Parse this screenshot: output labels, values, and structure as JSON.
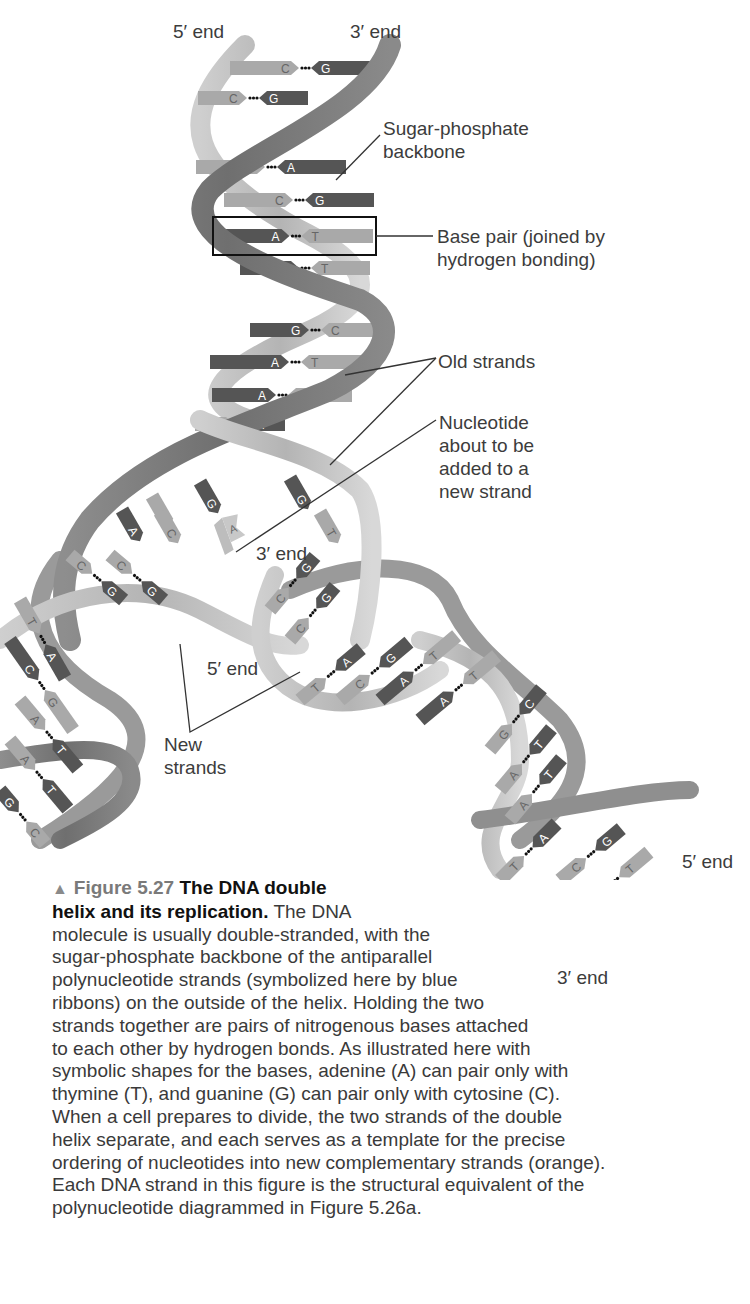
{
  "figure": {
    "labels": {
      "top_5_end": "5′ end",
      "top_3_end": "3′ end",
      "sugar_phosphate": [
        "Sugar-phosphate",
        "backbone"
      ],
      "base_pair": [
        "Base pair (joined by",
        "hydrogen bonding)"
      ],
      "old_strands": "Old strands",
      "nucleotide": [
        "Nucleotide",
        "about to be",
        "added to a",
        "new strand"
      ],
      "mid_3_end": "3′ end",
      "mid_5_end": "5′ end",
      "new_strands": [
        "New",
        "strands"
      ],
      "right_5_end": "5′ end",
      "bottom_3_end": "3′ end"
    },
    "top_helix_pairs": [
      {
        "left": "C",
        "right": "G"
      },
      {
        "left": "C",
        "right": "G"
      },
      {
        "left": "T",
        "right": "A"
      },
      {
        "left": "C",
        "right": "G"
      },
      {
        "left": "A",
        "right": "T"
      },
      {
        "left": "A",
        "right": "T"
      },
      {
        "left": "G",
        "right": "C"
      },
      {
        "left": "A",
        "right": "T"
      },
      {
        "left": "A",
        "right": "T"
      },
      {
        "left": "T",
        "right": "A"
      }
    ],
    "fork_unpaired_bases": [
      "G",
      "C",
      "A",
      "C",
      "G",
      "T"
    ],
    "free_nucleotide": "A",
    "left_daughter_pairs": [
      {
        "left": "C",
        "right": "G"
      },
      {
        "left": "C",
        "right": "G"
      },
      {
        "left": "T",
        "right": "A"
      },
      {
        "left": "C",
        "right": "G"
      },
      {
        "left": "A",
        "right": "T"
      },
      {
        "left": "A",
        "right": "T"
      },
      {
        "left": "G",
        "right": "C"
      }
    ],
    "right_daughter_pairs": [
      {
        "left": "C",
        "right": "G"
      },
      {
        "left": "C",
        "right": "G"
      },
      {
        "left": "T",
        "right": "A"
      },
      {
        "left": "C",
        "right": "G"
      },
      {
        "left": "A",
        "right": "T"
      },
      {
        "left": "A",
        "right": "T"
      },
      {
        "left": "G",
        "right": "C"
      },
      {
        "left": "A",
        "right": "T"
      },
      {
        "left": "A",
        "right": "T"
      },
      {
        "left": "T",
        "right": "A"
      },
      {
        "left": "C",
        "right": "G"
      },
      {
        "left": "A",
        "right": "T"
      }
    ],
    "colors": {
      "ribbon_light": "#b8b8b8",
      "ribbon_dark": "#7a7a7a",
      "base_dark": "#555555",
      "base_light": "#a9a9a9",
      "base_letter_light": "#ffffff",
      "base_letter_dark": "#666666",
      "dots": "#111111",
      "leader": "#333333"
    }
  },
  "caption": {
    "marker": "▲",
    "figure_number": "Figure 5.27",
    "title_line1": "The DNA double",
    "title_line2": "helix and its replication.",
    "body_first": " The DNA",
    "lines": [
      "molecule is usually double-stranded, with the",
      "sugar-phosphate backbone of the antiparallel",
      "polynucleotide strands (symbolized here by blue",
      "ribbons) on the outside of the helix. Holding the two",
      "strands together are pairs of nitrogenous bases attached",
      "to each other by hydrogen bonds. As illustrated here with",
      "symbolic shapes for the bases, adenine (A) can pair only with",
      "thymine (T), and guanine (G) can pair only with cytosine (C).",
      "When a cell prepares to divide, the two strands of the double",
      "helix separate, and each serves as a template for the precise",
      "ordering of nucleotides into new complementary strands (orange).",
      "Each DNA strand in this figure is the structural equivalent of the",
      "polynucleotide diagrammed in Figure 5.26a."
    ]
  }
}
